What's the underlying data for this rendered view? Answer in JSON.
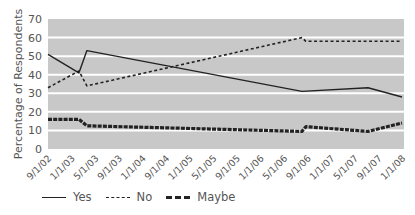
{
  "chart_data": {
    "type": "line",
    "title": "",
    "xlabel": "",
    "ylabel": "Percentage of Respondents",
    "ylim": [
      0,
      70
    ],
    "yticks": [
      0,
      10,
      20,
      30,
      40,
      50,
      60,
      70
    ],
    "grid": true,
    "legend_position": "bottom",
    "categories": [
      "9/1/02",
      "1/1/03",
      "5/1/03",
      "9/1/03",
      "1/1/04",
      "9/1/04",
      "1/1/05",
      "5/1/05",
      "9/1/05",
      "1/1/06",
      "5/1/06",
      "9/1/06",
      "1/1/07",
      "5/1/07",
      "9/1/07",
      "1/1/08"
    ],
    "series": [
      {
        "name": "Yes",
        "style": "solid",
        "points": [
          {
            "x": "9/1/02",
            "pos": 0.0,
            "y": 51
          },
          {
            "x": "~2/03",
            "pos": 1.31,
            "y": 41
          },
          {
            "x": "~3/03",
            "pos": 1.65,
            "y": 53
          },
          {
            "x": "~8/06",
            "pos": 10.76,
            "y": 31
          },
          {
            "x": "~8/07",
            "pos": 13.56,
            "y": 33
          },
          {
            "x": "1/1/08",
            "pos": 15.0,
            "y": 28
          }
        ]
      },
      {
        "name": "No",
        "style": "dotted",
        "points": [
          {
            "x": "9/1/02",
            "pos": 0.0,
            "y": 33
          },
          {
            "x": "~2/03",
            "pos": 1.31,
            "y": 42
          },
          {
            "x": "~3/03",
            "pos": 1.65,
            "y": 34
          },
          {
            "x": "~8/06",
            "pos": 10.76,
            "y": 60
          },
          {
            "x": "~9/06",
            "pos": 10.93,
            "y": 58
          },
          {
            "x": "1/1/08",
            "pos": 15.0,
            "y": 58
          }
        ]
      },
      {
        "name": "Maybe",
        "style": "thick-dashed",
        "points": [
          {
            "x": "9/1/02",
            "pos": 0.0,
            "y": 16
          },
          {
            "x": "~2/03",
            "pos": 1.31,
            "y": 16
          },
          {
            "x": "~3/03",
            "pos": 1.65,
            "y": 12.5
          },
          {
            "x": "~8/06",
            "pos": 10.76,
            "y": 9.5
          },
          {
            "x": "~9/06",
            "pos": 10.93,
            "y": 12
          },
          {
            "x": "~8/07",
            "pos": 13.56,
            "y": 9.5
          },
          {
            "x": "1/1/08",
            "pos": 15.0,
            "y": 14
          }
        ]
      }
    ]
  },
  "colors": {
    "plot_bg": "#c8c8c8",
    "gridline": "#ffffff",
    "line": "#222222",
    "text": "#555555"
  },
  "legend": {
    "items": [
      {
        "label": "Yes"
      },
      {
        "label": "No"
      },
      {
        "label": "Maybe"
      }
    ]
  }
}
